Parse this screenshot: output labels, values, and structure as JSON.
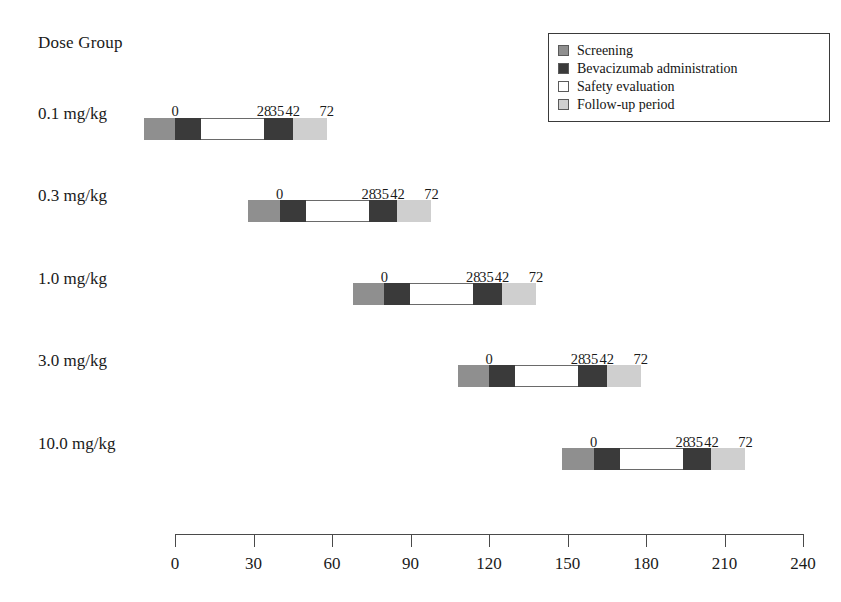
{
  "header": {
    "axis_title": "Dose Group"
  },
  "legend": {
    "items": [
      {
        "key": "screening",
        "label": "Screening",
        "color": "#8f8f8f"
      },
      {
        "key": "bev",
        "label": "Bevacizumab administration",
        "color": "#3a3a3a"
      },
      {
        "key": "safety",
        "label": "Safety evaluation",
        "color": "#ffffff"
      },
      {
        "key": "followup",
        "label": "Follow-up period",
        "color": "#cfcfcf"
      }
    ]
  },
  "chart_data": {
    "type": "bar",
    "title": "Dose Group",
    "xlabel": "",
    "ylabel": "Dose Group",
    "xlim": [
      0,
      240
    ],
    "grid": false,
    "legend_position": "top-right",
    "xticks": [
      0,
      30,
      60,
      90,
      120,
      150,
      180,
      210,
      240
    ],
    "xticklabels": [
      "0",
      "30",
      "60",
      "90",
      "120",
      "150",
      "180",
      "210",
      "240"
    ],
    "categories": [
      "0.1 mg/kg",
      "0.3 mg/kg",
      "1.0 mg/kg",
      "3.0 mg/kg",
      "10.0 mg/kg"
    ],
    "segment_names": [
      "Screening",
      "Bevacizumab administration",
      "Safety evaluation",
      "Bevacizumab administration",
      "Follow-up period"
    ],
    "relative_day_labels": [
      "0",
      "28",
      "35",
      "42",
      "72"
    ],
    "series": [
      {
        "name": "0.1 mg/kg",
        "cohort_start_day": -12,
        "day_offset": 0,
        "segments": [
          {
            "type": "screening",
            "start": -12,
            "end": 0
          },
          {
            "type": "bev",
            "start": 0,
            "end": 10
          },
          {
            "type": "safety",
            "start": 10,
            "end": 34
          },
          {
            "type": "bev",
            "start": 34,
            "end": 45
          },
          {
            "type": "followup",
            "start": 45,
            "end": 58
          }
        ],
        "marker_days": [
          {
            "label": "0",
            "day": 0
          },
          {
            "label": "28",
            "day": 34
          },
          {
            "label": "35",
            "day": 39
          },
          {
            "label": "42",
            "day": 45
          },
          {
            "label": "72",
            "day": 58
          }
        ]
      },
      {
        "name": "0.3 mg/kg",
        "cohort_start_day": 28,
        "day_offset": 40,
        "segments": [
          {
            "type": "screening",
            "start": 28,
            "end": 40
          },
          {
            "type": "bev",
            "start": 40,
            "end": 50
          },
          {
            "type": "safety",
            "start": 50,
            "end": 74
          },
          {
            "type": "bev",
            "start": 74,
            "end": 85
          },
          {
            "type": "followup",
            "start": 85,
            "end": 98
          }
        ],
        "marker_days": [
          {
            "label": "0",
            "day": 40
          },
          {
            "label": "28",
            "day": 74
          },
          {
            "label": "35",
            "day": 79
          },
          {
            "label": "42",
            "day": 85
          },
          {
            "label": "72",
            "day": 98
          }
        ]
      },
      {
        "name": "1.0 mg/kg",
        "cohort_start_day": 68,
        "day_offset": 80,
        "segments": [
          {
            "type": "screening",
            "start": 68,
            "end": 80
          },
          {
            "type": "bev",
            "start": 80,
            "end": 90
          },
          {
            "type": "safety",
            "start": 90,
            "end": 114
          },
          {
            "type": "bev",
            "start": 114,
            "end": 125
          },
          {
            "type": "followup",
            "start": 125,
            "end": 138
          }
        ],
        "marker_days": [
          {
            "label": "0",
            "day": 80
          },
          {
            "label": "28",
            "day": 114
          },
          {
            "label": "35",
            "day": 119
          },
          {
            "label": "42",
            "day": 125
          },
          {
            "label": "72",
            "day": 138
          }
        ]
      },
      {
        "name": "3.0 mg/kg",
        "cohort_start_day": 108,
        "day_offset": 120,
        "segments": [
          {
            "type": "screening",
            "start": 108,
            "end": 120
          },
          {
            "type": "bev",
            "start": 120,
            "end": 130
          },
          {
            "type": "safety",
            "start": 130,
            "end": 154
          },
          {
            "type": "bev",
            "start": 154,
            "end": 165
          },
          {
            "type": "followup",
            "start": 165,
            "end": 178
          }
        ],
        "marker_days": [
          {
            "label": "0",
            "day": 120
          },
          {
            "label": "28",
            "day": 154
          },
          {
            "label": "35",
            "day": 159
          },
          {
            "label": "42",
            "day": 165
          },
          {
            "label": "72",
            "day": 178
          }
        ]
      },
      {
        "name": "10.0 mg/kg",
        "cohort_start_day": 148,
        "day_offset": 160,
        "segments": [
          {
            "type": "screening",
            "start": 148,
            "end": 160
          },
          {
            "type": "bev",
            "start": 160,
            "end": 170
          },
          {
            "type": "safety",
            "start": 170,
            "end": 194
          },
          {
            "type": "bev",
            "start": 194,
            "end": 205
          },
          {
            "type": "followup",
            "start": 205,
            "end": 218
          }
        ],
        "marker_days": [
          {
            "label": "0",
            "day": 160
          },
          {
            "label": "28",
            "day": 194
          },
          {
            "label": "35",
            "day": 199
          },
          {
            "label": "42",
            "day": 205
          },
          {
            "label": "72",
            "day": 218
          }
        ]
      }
    ]
  }
}
